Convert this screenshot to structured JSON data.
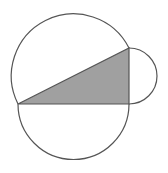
{
  "diagram": {
    "colors": {
      "background": "#ffffff",
      "stroke": "#555555",
      "triangle_fill": "#a0a0a0"
    },
    "triangle": {
      "vertices": [
        [
          18,
          104
        ],
        [
          129,
          104
        ],
        [
          129,
          48
        ]
      ],
      "right_angle_at": [
        129,
        104
      ]
    },
    "semicircles": [
      {
        "name": "hypotenuse",
        "center": [
          73.5,
          76
        ],
        "radius": 62
      },
      {
        "name": "base",
        "center": [
          73.5,
          104
        ],
        "radius": 55.5
      },
      {
        "name": "vertical-leg",
        "center": [
          129,
          76
        ],
        "radius": 28
      }
    ]
  }
}
